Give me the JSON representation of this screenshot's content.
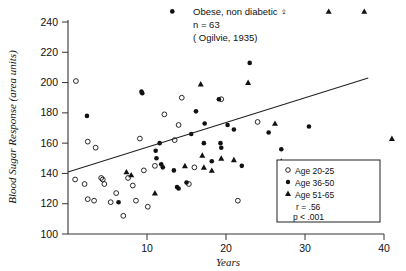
{
  "chart_data": {
    "type": "scatter",
    "title": "Obese, non diabetic ♀",
    "subtitle_n": "n = 63",
    "source": "( Ogilvie, 1935)",
    "xlabel": "Years",
    "ylabel": "Blood Sugar Response (area units)",
    "xlim": [
      0,
      40
    ],
    "ylim": [
      100,
      240
    ],
    "xticks": [
      10,
      20,
      30,
      40
    ],
    "yticks": [
      100,
      120,
      140,
      160,
      180,
      200,
      220,
      240
    ],
    "grid": false,
    "legend_position": "bottom-right",
    "legend": [
      {
        "label": "Age  20-25",
        "marker": "open-circle"
      },
      {
        "label": "Age  36-50",
        "marker": "filled-circle"
      },
      {
        "label": "Age  51-65",
        "marker": "filled-triangle"
      }
    ],
    "stats": {
      "r": "r = .56",
      "p": "p < .001"
    },
    "regression_line": {
      "x0": 0,
      "y0": 141,
      "x1": 38,
      "y1": 203
    },
    "series": [
      {
        "name": "Age  20-25",
        "marker": "open-circle",
        "points": [
          [
            1.0,
            201
          ],
          [
            2.5,
            161
          ],
          [
            3.5,
            157
          ],
          [
            0.9,
            136
          ],
          [
            2.1,
            133
          ],
          [
            2.5,
            123
          ],
          [
            3.3,
            122
          ],
          [
            4.2,
            137
          ],
          [
            4.4,
            136
          ],
          [
            4.6,
            133
          ],
          [
            5.4,
            121
          ],
          [
            6.1,
            127
          ],
          [
            7.0,
            112
          ],
          [
            7.6,
            137
          ],
          [
            8.2,
            132
          ],
          [
            8.6,
            122
          ],
          [
            9.1,
            163
          ],
          [
            9.6,
            142
          ],
          [
            10.1,
            118
          ],
          [
            11.0,
            145
          ],
          [
            12.2,
            179
          ],
          [
            13.5,
            162
          ],
          [
            14.0,
            172
          ],
          [
            14.4,
            190
          ],
          [
            15.3,
            133
          ],
          [
            16.0,
            144
          ],
          [
            19.4,
            189
          ],
          [
            24.0,
            174
          ],
          [
            21.5,
            122
          ]
        ]
      },
      {
        "name": "Age  36-50",
        "marker": "filled-circle",
        "points": [
          [
            2.4,
            178
          ],
          [
            9.3,
            194
          ],
          [
            9.4,
            193
          ],
          [
            11.1,
            155
          ],
          [
            11.2,
            150
          ],
          [
            11.6,
            160
          ],
          [
            11.8,
            146
          ],
          [
            12.0,
            144
          ],
          [
            13.2,
            247
          ],
          [
            13.4,
            142
          ],
          [
            15.6,
            166
          ],
          [
            16.2,
            181
          ],
          [
            17.2,
            160
          ],
          [
            17.3,
            173
          ],
          [
            18.2,
            148
          ],
          [
            19.1,
            189
          ],
          [
            19.3,
            160
          ],
          [
            19.4,
            157
          ],
          [
            20.2,
            172
          ],
          [
            21.0,
            169
          ],
          [
            22.0,
            145
          ],
          [
            23.0,
            213
          ],
          [
            25.4,
            167
          ],
          [
            27.0,
            156
          ],
          [
            30.5,
            171
          ],
          [
            6.4,
            121
          ],
          [
            13.8,
            131
          ],
          [
            14.0,
            130
          ],
          [
            15.0,
            134
          ]
        ]
      },
      {
        "name": "Age  51-65",
        "marker": "filled-triangle",
        "points": [
          [
            7.4,
            141
          ],
          [
            8.0,
            139
          ],
          [
            11.0,
            127
          ],
          [
            14.8,
            145
          ],
          [
            16.8,
            199
          ],
          [
            17.0,
            152
          ],
          [
            17.2,
            144
          ],
          [
            18.2,
            142
          ],
          [
            19.4,
            150
          ],
          [
            21.0,
            149
          ],
          [
            22.8,
            200
          ],
          [
            26.2,
            173
          ],
          [
            27.0,
            148
          ],
          [
            33.0,
            247
          ],
          [
            37.5,
            247
          ],
          [
            41.0,
            163
          ]
        ]
      }
    ]
  }
}
